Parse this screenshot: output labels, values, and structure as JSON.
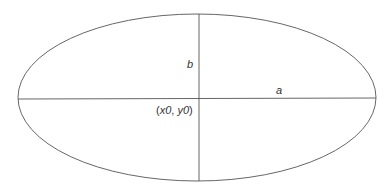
{
  "diagram": {
    "title": "",
    "ellipse": {
      "cx": 197,
      "cy": 97.5,
      "rx": 179,
      "ry": 83.5,
      "stroke": "#555555"
    },
    "labels": {
      "semi_minor": "b",
      "semi_major": "a",
      "center_x": "x0",
      "center_y": "y0",
      "center_open": "(",
      "center_sep": ", ",
      "center_close": ")"
    }
  }
}
